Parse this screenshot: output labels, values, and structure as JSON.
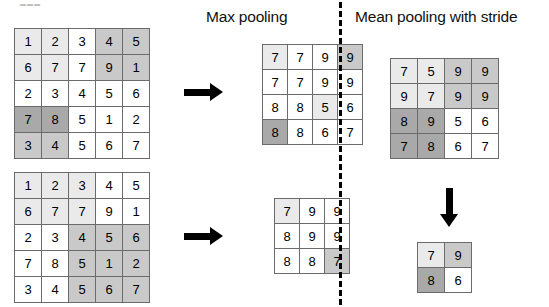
{
  "figure": {
    "titles": {
      "max_pooling": "Max pooling",
      "mean_pooling": "Mean pooling with stride"
    },
    "artifact_text": "▬▬▬"
  },
  "grids": {
    "input_top": {
      "name": "input-matrix-top",
      "rows": 5,
      "cols": 5,
      "values": [
        [
          1,
          2,
          3,
          4,
          5
        ],
        [
          6,
          7,
          7,
          9,
          1
        ],
        [
          2,
          3,
          4,
          5,
          6
        ],
        [
          7,
          8,
          5,
          1,
          2
        ],
        [
          3,
          4,
          5,
          6,
          7
        ]
      ],
      "shades": [
        [
          "light",
          "light",
          "white",
          "mid",
          "mid"
        ],
        [
          "light",
          "light",
          "white",
          "mid",
          "mid"
        ],
        [
          "white",
          "white",
          "white",
          "white",
          "white"
        ],
        [
          "dark",
          "dark",
          "white",
          "white",
          "white"
        ],
        [
          "mid",
          "mid",
          "white",
          "white",
          "white"
        ]
      ]
    },
    "output_top": {
      "name": "max-pooling-output-top",
      "rows": 4,
      "cols": 4,
      "values": [
        [
          7,
          7,
          9,
          9
        ],
        [
          7,
          7,
          9,
          9
        ],
        [
          8,
          8,
          5,
          6
        ],
        [
          8,
          8,
          6,
          7
        ]
      ],
      "shades": [
        [
          "light",
          "white",
          "white",
          "mid"
        ],
        [
          "white",
          "white",
          "white",
          "white"
        ],
        [
          "white",
          "white",
          "light",
          "white"
        ],
        [
          "dark",
          "white",
          "white",
          "white"
        ]
      ]
    },
    "input_bottom": {
      "name": "input-matrix-bottom",
      "rows": 5,
      "cols": 5,
      "values": [
        [
          1,
          2,
          3,
          4,
          5
        ],
        [
          6,
          7,
          7,
          9,
          1
        ],
        [
          2,
          3,
          4,
          5,
          6
        ],
        [
          7,
          8,
          5,
          1,
          2
        ],
        [
          3,
          4,
          5,
          6,
          7
        ]
      ],
      "shades": [
        [
          "light",
          "light",
          "light",
          "white",
          "white"
        ],
        [
          "light",
          "light",
          "light",
          "white",
          "white"
        ],
        [
          "white",
          "white",
          "mid",
          "mid",
          "mid"
        ],
        [
          "white",
          "white",
          "mid",
          "mid",
          "mid"
        ],
        [
          "white",
          "white",
          "mid",
          "mid",
          "mid"
        ]
      ]
    },
    "output_bottom": {
      "name": "max-pooling-output-bottom",
      "rows": 3,
      "cols": 3,
      "values": [
        [
          7,
          9,
          9
        ],
        [
          8,
          9,
          9
        ],
        [
          8,
          8,
          7
        ]
      ],
      "shades": [
        [
          "light",
          "white",
          "white"
        ],
        [
          "white",
          "white",
          "white"
        ],
        [
          "white",
          "white",
          "mid"
        ]
      ]
    },
    "mean_input": {
      "name": "mean-pooling-input-matrix",
      "rows": 4,
      "cols": 4,
      "values": [
        [
          7,
          5,
          9,
          9
        ],
        [
          9,
          7,
          9,
          9
        ],
        [
          8,
          9,
          5,
          6
        ],
        [
          7,
          8,
          6,
          7
        ]
      ],
      "shades": [
        [
          "light",
          "light",
          "mid",
          "mid"
        ],
        [
          "light",
          "light",
          "mid",
          "mid"
        ],
        [
          "dark",
          "dark",
          "white",
          "white"
        ],
        [
          "dark",
          "dark",
          "white",
          "white"
        ]
      ]
    },
    "mean_output": {
      "name": "mean-pooling-output-matrix",
      "rows": 2,
      "cols": 2,
      "values": [
        [
          7,
          9
        ],
        [
          8,
          6
        ]
      ],
      "shades": [
        [
          "light",
          "mid"
        ],
        [
          "dark",
          "white"
        ]
      ]
    }
  },
  "arrows": {
    "top_arrow": "arrow-right-icon",
    "bottom_arrow": "arrow-right-icon",
    "mean_arrow": "arrow-down-icon",
    "divider": "dashed-vertical-divider"
  },
  "colors": {
    "white": "#ffffff",
    "light": "#eaeaea",
    "mid": "#c9c9c9",
    "dark": "#a9a9a9",
    "border": "#6b6b6b",
    "ink": "#000000"
  }
}
